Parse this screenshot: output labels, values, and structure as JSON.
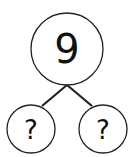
{
  "diagram": {
    "type": "number-bond",
    "whole": {
      "label": "9"
    },
    "parts": [
      {
        "label": "?"
      },
      {
        "label": "?"
      }
    ],
    "colors": {
      "stroke": "#222222",
      "background": "#ffffff"
    }
  }
}
